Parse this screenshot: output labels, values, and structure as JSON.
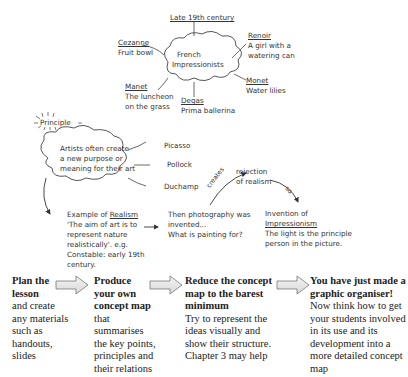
{
  "concept_map": {
    "top": {
      "center": "French Impressionists",
      "center_lines": [
        "French",
        "Impressionists"
      ],
      "era": "Late 19th century",
      "artists": [
        {
          "name": "Cezanne",
          "work": "Fruit bowl"
        },
        {
          "name": "Renoir",
          "work_lines": [
            "A girl with a",
            "watering can"
          ]
        },
        {
          "name": "Monet",
          "work": "Water lilies"
        },
        {
          "name": "Degas",
          "work": "Prima ballerina"
        },
        {
          "name": "Manet",
          "work_lines": [
            "The luncheon",
            "on the grass"
          ]
        }
      ]
    },
    "principle": {
      "label": "Principle",
      "cloud_lines": [
        "Artists often create",
        "a new purpose or",
        "meaning for their art"
      ],
      "examples": [
        "Picasso",
        "Pollock",
        "Duchamp"
      ]
    },
    "realism": {
      "prefix": "Example of ",
      "term": "Realism",
      "lines": [
        "'The aim of art is to",
        "represent nature",
        "realistically'. e.g.",
        "Constable: early 19th",
        "century."
      ]
    },
    "photography": {
      "lines": [
        "Then photography was",
        "invented...",
        "What is painting for?"
      ]
    },
    "creates_label": "creates",
    "rejection": {
      "lines": [
        "rejection",
        "of realism"
      ]
    },
    "so_label": "so",
    "impressionism": {
      "prefix": "Invention of",
      "term": "Impressionism",
      "lines": [
        "The light is the principle",
        "person in the picture."
      ]
    }
  },
  "steps": [
    {
      "title_lines": [
        "Plan the",
        "lesson"
      ],
      "body_lines": [
        "and create",
        "any materials",
        "such as",
        "handouts,",
        "slides"
      ]
    },
    {
      "title_lines": [
        "Produce",
        "your own",
        "concept map"
      ],
      "body_lines": [
        "that",
        "summarises",
        "the key points,",
        "principles and",
        "their relations"
      ]
    },
    {
      "title_lines": [
        "Reduce the concept",
        "map to the barest",
        "minimum"
      ],
      "body_lines": [
        "Try to represent the",
        "ideas visually and",
        "show their structure.",
        "Chapter 3 may help"
      ]
    },
    {
      "title_lines": [
        "You have just made a",
        "graphic organiser!"
      ],
      "body_lines": [
        "Now think how to get",
        "your students involved",
        "in its use and its",
        "development into a",
        "more detailed concept",
        "map"
      ]
    }
  ],
  "colors": {
    "ink": "#333333",
    "arrow_fill": "#e6e6e6",
    "arrow_stroke": "#777777"
  }
}
